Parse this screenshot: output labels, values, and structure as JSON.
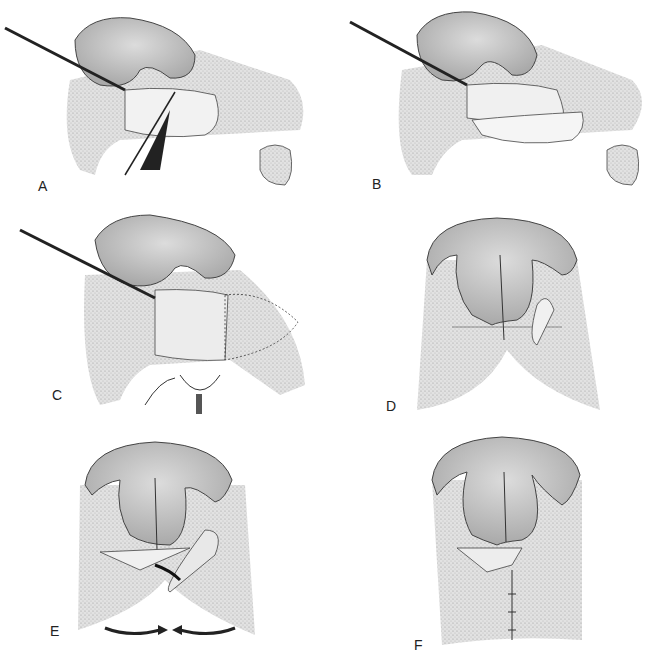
{
  "figure": {
    "panels": [
      {
        "id": "A",
        "label": "A",
        "description": "Lateral view; instrument retracts nasal ala, incision with scalpel through lip tissue"
      },
      {
        "id": "B",
        "label": "B",
        "description": "Lateral view; retracted ala with exposed defect region"
      },
      {
        "id": "C",
        "label": "C",
        "description": "Lateral view; flap raised with hook and forceps below"
      },
      {
        "id": "D",
        "label": "D",
        "description": "Frontal view; nose with planned incision lines on lip flaps"
      },
      {
        "id": "E",
        "label": "E",
        "description": "Frontal view; flaps rotated with arrows indicating advancement toward midline"
      },
      {
        "id": "F",
        "label": "F",
        "description": "Frontal view; closed repair with sutures along midline"
      }
    ],
    "colors": {
      "background": "#ffffff",
      "tissue_fill": "#cfcfcf",
      "fur_fill": "#d9d9d9",
      "outline": "#333333",
      "shadow": "#8a8a8a"
    }
  }
}
